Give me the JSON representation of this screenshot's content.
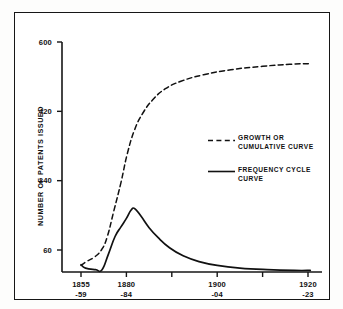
{
  "page": {
    "top_fragment": ""
  },
  "chart_data": {
    "type": "line",
    "title": "",
    "xlabel": "",
    "ylabel": "NUMBER OF PATENTS ISSUED",
    "ylim": [
      0,
      660
    ],
    "xlim": [
      0,
      5
    ],
    "grid": false,
    "legend_position": "center-right",
    "y_ticks": [
      {
        "value": 600,
        "label": "600"
      },
      {
        "value": 420,
        "label": "420"
      },
      {
        "value": 240,
        "label": "240"
      },
      {
        "value": 60,
        "label": "60"
      }
    ],
    "x_ticks": [
      {
        "pos": 0,
        "line1": "1855",
        "line2": "-59"
      },
      {
        "pos": 1,
        "line1": "1880",
        "line2": "-84"
      },
      {
        "pos": 2,
        "line1": "",
        "line2": ""
      },
      {
        "pos": 3,
        "line1": "1900",
        "line2": "-04"
      },
      {
        "pos": 4,
        "line1": "",
        "line2": ""
      },
      {
        "pos": 5,
        "line1": "1920",
        "line2": "-23"
      }
    ],
    "series": [
      {
        "name": "GROWTH OR CUMULATIVE CURVE",
        "style": "dashed",
        "color": "#111111",
        "legend_line1": "GROWTH OR",
        "legend_line2": "CUMULATIVE CURVE",
        "points": [
          {
            "x": 0.0,
            "y": 20
          },
          {
            "x": 0.12,
            "y": 30
          },
          {
            "x": 0.3,
            "y": 42
          },
          {
            "x": 0.46,
            "y": 62
          },
          {
            "x": 0.58,
            "y": 95
          },
          {
            "x": 0.72,
            "y": 160
          },
          {
            "x": 0.88,
            "y": 235
          },
          {
            "x": 1.02,
            "y": 310
          },
          {
            "x": 1.18,
            "y": 372
          },
          {
            "x": 1.36,
            "y": 415
          },
          {
            "x": 1.58,
            "y": 450
          },
          {
            "x": 1.85,
            "y": 478
          },
          {
            "x": 2.2,
            "y": 498
          },
          {
            "x": 2.7,
            "y": 515
          },
          {
            "x": 3.3,
            "y": 528
          },
          {
            "x": 4.0,
            "y": 537
          },
          {
            "x": 4.6,
            "y": 542
          },
          {
            "x": 5.05,
            "y": 544
          }
        ]
      },
      {
        "name": "FREQUENCY CYCLE CURVE",
        "style": "solid",
        "color": "#111111",
        "legend_line1": "FREQUENCY CYCLE",
        "legend_line2": "CURVE",
        "points": [
          {
            "x": 0.0,
            "y": 22
          },
          {
            "x": 0.1,
            "y": 13
          },
          {
            "x": 0.32,
            "y": 9
          },
          {
            "x": 0.46,
            "y": 8
          },
          {
            "x": 0.6,
            "y": 48
          },
          {
            "x": 0.75,
            "y": 95
          },
          {
            "x": 0.88,
            "y": 120
          },
          {
            "x": 1.0,
            "y": 142
          },
          {
            "x": 1.1,
            "y": 163
          },
          {
            "x": 1.18,
            "y": 168
          },
          {
            "x": 1.32,
            "y": 148
          },
          {
            "x": 1.5,
            "y": 118
          },
          {
            "x": 1.7,
            "y": 92
          },
          {
            "x": 1.95,
            "y": 66
          },
          {
            "x": 2.25,
            "y": 45
          },
          {
            "x": 2.6,
            "y": 30
          },
          {
            "x": 3.0,
            "y": 20
          },
          {
            "x": 3.5,
            "y": 13
          },
          {
            "x": 4.1,
            "y": 9
          },
          {
            "x": 4.7,
            "y": 7
          },
          {
            "x": 5.05,
            "y": 7
          }
        ]
      }
    ]
  },
  "legend": {
    "items": [
      {
        "line1": "GROWTH OR",
        "line2": "CUMULATIVE CURVE",
        "style": "dashed"
      },
      {
        "line1": "FREQUENCY CYCLE",
        "line2": "CURVE",
        "style": "solid"
      }
    ]
  }
}
